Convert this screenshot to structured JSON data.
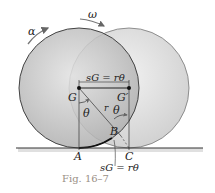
{
  "figure": {
    "caption": "Fig. 16–7",
    "labels": {
      "alpha": "α",
      "omega": "ω",
      "sG_top": "sG = rθ",
      "G": "G",
      "G_prime": "G′",
      "theta_left": "θ",
      "theta_right": "θ",
      "r": "r",
      "B": "B",
      "A": "A",
      "C": "C",
      "sG_bottom": "sG = rθ"
    },
    "colors": {
      "disk_fill": "#c9c9c9",
      "disk_edge": "#555555",
      "ghost_fill": "#e6e6e6",
      "ground": "#444444",
      "caption": "#9a8f86"
    }
  }
}
